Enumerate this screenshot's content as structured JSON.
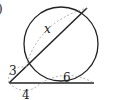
{
  "problem": {
    "number_label": ")"
  },
  "diagram": {
    "type": "secant-secant",
    "circle": {
      "cx": 61,
      "cy": 44,
      "r": 37
    },
    "external_point": {
      "x": 9,
      "y": 83
    },
    "secant1": {
      "near_point": {
        "x": 26,
        "y": 67
      },
      "far_point": {
        "x": 87,
        "y": 8
      },
      "external_segment_label": "3",
      "internal_segment_label": "x"
    },
    "secant2": {
      "near_point": {
        "x": 41,
        "y": 83
      },
      "far_point": {
        "x": 94,
        "y": 83
      },
      "external_segment_label": "4",
      "internal_segment_label": "6"
    },
    "colors": {
      "stroke": "#222222",
      "dashed": "#999999"
    }
  }
}
